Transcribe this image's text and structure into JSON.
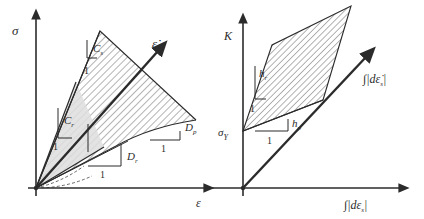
{
  "figure": {
    "background_color": "#ffffff",
    "ink_color": "#2b2b2b",
    "hatch_color": "#4a4a4a",
    "fill_color": "#e3e3e3",
    "panels": [
      {
        "id": "left",
        "name": "stress-strain-panel",
        "y_axis_label": "σ",
        "x_axis_label": "ε",
        "rate_arrow_label": "ε̇",
        "annotations": [
          {
            "name": "modulus-upper",
            "text": "C",
            "subscript": "s"
          },
          {
            "name": "modulus-lower",
            "text": "C",
            "subscript": "r"
          },
          {
            "name": "unit-slope-upper",
            "text": "1"
          },
          {
            "name": "unit-slope-lower",
            "text": "1"
          },
          {
            "name": "unit-slope-dr",
            "text": "1"
          },
          {
            "name": "unit-slope-dp",
            "text": "1"
          },
          {
            "name": "damage-rate",
            "text": "D",
            "subscript": "r"
          },
          {
            "name": "damage-plastic",
            "text": "D",
            "subscript": "p"
          }
        ]
      },
      {
        "id": "right",
        "name": "hardening-panel",
        "y_axis_label": "K",
        "x_axis_label": "∫|dε",
        "x_axis_label_sub": "s",
        "x_axis_label_tail": "|",
        "diagonal_label": "∫|dε̇",
        "diagonal_label_sub": "s",
        "diagonal_label_tail": "|",
        "yield_label": "σ",
        "yield_label_sub": "Y",
        "annotations": [
          {
            "name": "hardening-rate",
            "text": "h",
            "subscript": "r"
          },
          {
            "name": "hardening-plastic",
            "text": "h",
            "subscript": "p"
          },
          {
            "name": "unit-slope-hr",
            "text": "1"
          },
          {
            "name": "unit-slope-hp",
            "text": "1"
          }
        ]
      }
    ]
  }
}
